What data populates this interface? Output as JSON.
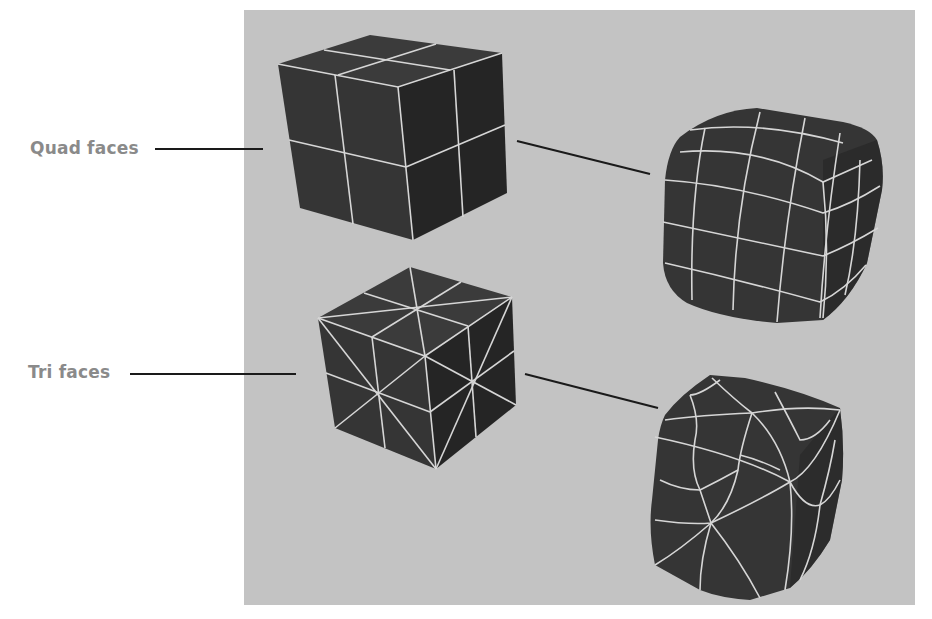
{
  "figure": {
    "labels": [
      {
        "id": "quad",
        "text": "Quad faces"
      },
      {
        "id": "tri",
        "text": "Tri faces"
      }
    ],
    "panel_color": "#c3c3c3",
    "mesh_color": "#303030",
    "wire_color": "#d6d6d6",
    "leader_color": "#1a1a1a",
    "objects": [
      {
        "name": "quad-cube",
        "description": "Cube with quad faces (2x2 per face)"
      },
      {
        "name": "quad-cube-smoothed",
        "description": "Smoothed cube from quad faces"
      },
      {
        "name": "tri-cube",
        "description": "Cube with triangulated faces"
      },
      {
        "name": "tri-cube-smoothed",
        "description": "Smoothed cube from tri faces"
      }
    ]
  }
}
